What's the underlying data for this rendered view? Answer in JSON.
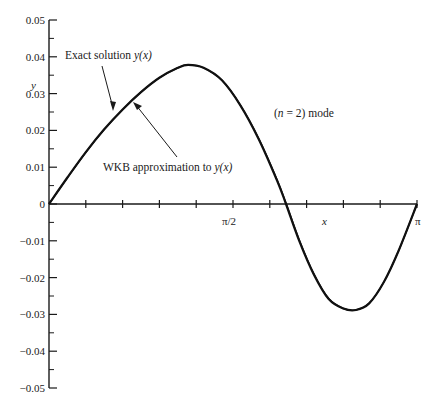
{
  "chart_data": {
    "type": "line",
    "title": "",
    "xlabel": "x",
    "ylabel": "y",
    "xlim": [
      0,
      3.14159
    ],
    "ylim": [
      -0.05,
      0.05
    ],
    "grid": false,
    "x_tick_count": 10,
    "x_tick_labels": [
      {
        "at_pi_fraction": 0.5,
        "label": "π/2"
      },
      {
        "at_pi_fraction": 1.0,
        "label": "π"
      }
    ],
    "y_ticks": [
      0.05,
      0.04,
      0.03,
      0.02,
      0.01,
      0,
      -0.01,
      -0.02,
      -0.03,
      -0.04,
      -0.05
    ],
    "y_tick_labels": [
      "0.05",
      "0.04",
      "0.03",
      "0.02",
      "0.01",
      "0",
      "-0.01",
      "-0.02",
      "-0.03",
      "-0.04",
      "-0.05"
    ],
    "series": [
      {
        "name": "Exact solution y(x)",
        "x_pi_fraction": [
          0,
          0.05,
          0.1,
          0.15,
          0.2,
          0.25,
          0.3,
          0.35,
          0.378,
          0.42,
          0.47,
          0.52,
          0.57,
          0.62,
          0.644,
          0.68,
          0.72,
          0.76,
          0.8,
          0.834,
          0.87,
          0.91,
          0.95,
          1.0
        ],
        "values": [
          0,
          0.0072,
          0.0141,
          0.0203,
          0.0257,
          0.0304,
          0.0343,
          0.037,
          0.0378,
          0.037,
          0.0336,
          0.0268,
          0.0176,
          0.0063,
          0,
          -0.01,
          -0.0192,
          -0.0258,
          -0.0284,
          -0.0288,
          -0.027,
          -0.0212,
          -0.0127,
          0
        ]
      },
      {
        "name": "WKB approximation to y(x)",
        "x_pi_fraction": [
          0,
          0.05,
          0.1,
          0.15,
          0.2,
          0.25,
          0.3,
          0.35,
          0.378,
          0.42,
          0.47,
          0.52,
          0.57,
          0.62,
          0.644,
          0.68,
          0.72,
          0.76,
          0.8,
          0.834,
          0.87,
          0.91,
          0.95,
          1.0
        ],
        "values": [
          0,
          0.0071,
          0.014,
          0.0202,
          0.0256,
          0.0304,
          0.0343,
          0.037,
          0.0378,
          0.037,
          0.0336,
          0.0269,
          0.0178,
          0.0066,
          0.0003,
          -0.0097,
          -0.019,
          -0.0257,
          -0.0284,
          -0.0288,
          -0.027,
          -0.0212,
          -0.0127,
          0
        ]
      }
    ],
    "annotations": {
      "exact_label": "Exact solution y(x)",
      "wkb_label": "WKB approximation to y(x)",
      "mode_label": "(n = 2) mode"
    }
  },
  "labels": {
    "exact_prefix": "Exact solution ",
    "exact_fn": "y(x)",
    "wkb_prefix": "WKB approximation to ",
    "wkb_fn": "y(x)",
    "mode_open": "(",
    "mode_n": "n",
    "mode_rest": " = 2) mode",
    "y_axis": "y",
    "x_axis": "x",
    "pi_half": "π/2",
    "pi": "π"
  }
}
